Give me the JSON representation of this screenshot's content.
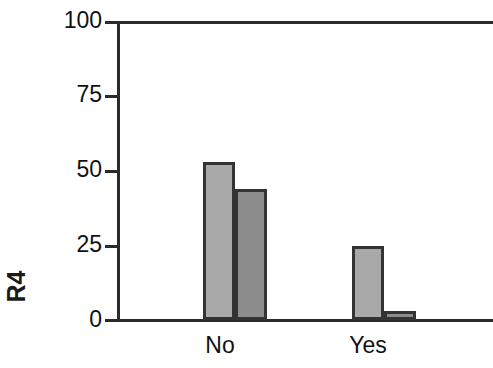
{
  "chart_data": {
    "type": "bar",
    "title": "",
    "xlabel": "",
    "ylabel": "R4",
    "categories": [
      "No",
      "Yes"
    ],
    "ylim": [
      0,
      100
    ],
    "yticks": [
      0,
      25,
      50,
      75,
      100
    ],
    "ytick_labels": [
      "0",
      "25",
      "50",
      "75",
      "100"
    ],
    "grid": false,
    "legend": "none",
    "series": [
      {
        "name": "series-1",
        "color": "#a9a9a9",
        "values": [
          53,
          25
        ]
      },
      {
        "name": "series-2",
        "color": "#8c8c8c",
        "values": [
          44,
          3
        ]
      }
    ],
    "bars": [
      {
        "category": "No",
        "series": "series-1",
        "value": 53,
        "color": "#a9a9a9"
      },
      {
        "category": "No",
        "series": "series-2",
        "value": 44,
        "color": "#8c8c8c"
      },
      {
        "category": "Yes",
        "series": "series-1",
        "value": 25,
        "color": "#a9a9a9"
      },
      {
        "category": "Yes",
        "series": "series-2",
        "value": 3,
        "color": "#8c8c8c"
      }
    ],
    "bar_edge_color": "#333333",
    "axis_color": "#2b2b2b",
    "background_color": "#ffffff"
  },
  "axis": {
    "y_title": "R4",
    "tick_0": "0",
    "tick_25": "25",
    "tick_50": "50",
    "tick_75": "75",
    "tick_100": "100"
  },
  "categories": {
    "cat_0": "No",
    "cat_1": "Yes"
  }
}
